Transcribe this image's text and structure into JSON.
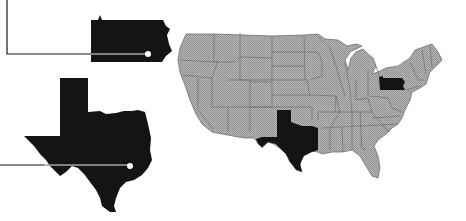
{
  "figure": {
    "description": "Map of the contiguous United States with Pennsylvania and Texas highlighted and enlarged callouts",
    "colors": {
      "background": "#ffffff",
      "map_fill": "#a9a9a9",
      "map_border": "#6e6e6e",
      "highlight_fill": "#141414",
      "leader_line": "#1a1a1a",
      "callout_dot": "#ffffff"
    }
  },
  "callouts": [
    {
      "state": "Pennsylvania",
      "abbr": "PA"
    },
    {
      "state": "Texas",
      "abbr": "TX"
    }
  ],
  "highlighted_states": [
    "Pennsylvania",
    "Texas"
  ]
}
